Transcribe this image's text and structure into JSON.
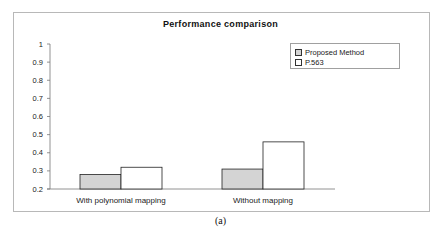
{
  "chart_data": {
    "type": "bar",
    "title": "Performance comparison",
    "xlabel": "",
    "ylabel": "",
    "categories": [
      "With polynomial mapping",
      "Without mapping"
    ],
    "series": [
      {
        "name": "Proposed Method",
        "values": [
          0.28,
          0.31
        ],
        "color": "#d4d4d4"
      },
      {
        "name": "P.563",
        "values": [
          0.32,
          0.46
        ],
        "color": "#ffffff"
      }
    ],
    "ylim": [
      0.2,
      1
    ],
    "yticks": [
      "0.2",
      "0.3",
      "0.4",
      "0.5",
      "0.6",
      "0.7",
      "0.8",
      "0.9",
      "1"
    ],
    "grid": false,
    "legend_position": "top-right"
  },
  "caption": "(a)"
}
